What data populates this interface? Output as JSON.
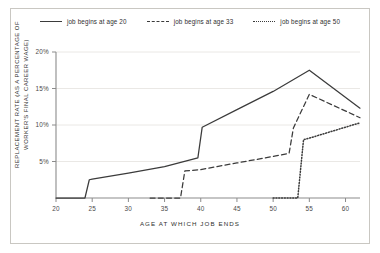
{
  "chart_data": {
    "type": "line",
    "title": "",
    "xlabel": "AGE AT WHICH JOB ENDS",
    "ylabel": "REPLACEMENT RATE (AS A PERCENTAGE OF WORKER'S FINAL CAREER WAGE)",
    "xlim": [
      20,
      62
    ],
    "ylim": [
      0,
      20
    ],
    "xticks": [
      20,
      25,
      30,
      35,
      40,
      45,
      50,
      55,
      60
    ],
    "xticklabels": [
      "20",
      "25",
      "30",
      "35",
      "40",
      "45",
      "50",
      "55",
      "60"
    ],
    "yticks": [
      5,
      10,
      15,
      20
    ],
    "yticklabels": [
      "5%",
      "10%",
      "15%",
      "20%"
    ],
    "grid": "horizontal",
    "legend_position": "top-center",
    "series": [
      {
        "name": "job begins at age 20",
        "style": "solid",
        "color": "#3b3b3b",
        "points": [
          [
            20,
            0.0
          ],
          [
            24,
            0.0
          ],
          [
            24.6,
            2.5
          ],
          [
            25,
            2.6
          ],
          [
            30,
            3.4
          ],
          [
            35,
            4.3
          ],
          [
            39.6,
            5.5
          ],
          [
            40.2,
            9.7
          ],
          [
            45,
            12.1
          ],
          [
            50,
            14.6
          ],
          [
            55,
            17.5
          ],
          [
            62,
            12.3
          ]
        ]
      },
      {
        "name": "job begins at age 33",
        "style": "dashed",
        "color": "#3b3b3b",
        "points": [
          [
            33,
            0.0
          ],
          [
            37.2,
            0.0
          ],
          [
            37.8,
            3.7
          ],
          [
            40,
            3.9
          ],
          [
            45,
            4.8
          ],
          [
            50,
            5.7
          ],
          [
            52.2,
            6.1
          ],
          [
            52.8,
            9.6
          ],
          [
            55,
            14.2
          ],
          [
            62,
            11.0
          ]
        ]
      },
      {
        "name": "job begins at age 50",
        "style": "dotted",
        "color": "#3b3b3b",
        "points": [
          [
            50,
            0.0
          ],
          [
            53.4,
            0.0
          ],
          [
            54.2,
            8.0
          ],
          [
            55,
            8.2
          ],
          [
            62,
            10.3
          ]
        ]
      }
    ]
  },
  "legend": {
    "items": [
      {
        "label": "job begins at age 20",
        "style": "solid"
      },
      {
        "label": "job begins at age 33",
        "style": "dashed"
      },
      {
        "label": "job begins at age 50",
        "style": "dotted"
      }
    ]
  },
  "axes": {
    "x_title": "AGE AT WHICH JOB ENDS",
    "y_title": "REPLACEMENT RATE (AS A PERCENTAGE OF WORKER'S FINAL CAREER WAGE)"
  }
}
